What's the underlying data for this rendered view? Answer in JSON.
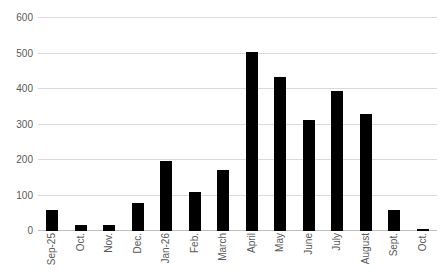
{
  "chart_data": {
    "type": "bar",
    "title": "",
    "subtitle": "",
    "xlabel": "",
    "ylabel": "",
    "categories": [
      "Sep-25",
      "Oct.",
      "Nov.",
      "Dec.",
      "Jan-26",
      "Feb.",
      "March",
      "April",
      "May",
      "June",
      "July",
      "August",
      "Sept.",
      "Oct."
    ],
    "values": [
      60,
      17,
      18,
      80,
      196,
      110,
      172,
      505,
      435,
      312,
      395,
      330,
      60,
      5
    ],
    "ylim": [
      0,
      600
    ],
    "y_ticks": [
      0,
      100,
      200,
      300,
      400,
      500,
      600
    ],
    "y_tick_labels": [
      "0",
      "100",
      "200",
      "300",
      "400",
      "500",
      "600"
    ],
    "grid": true,
    "legend": false,
    "legend_position": "none",
    "bar_color": "#000000",
    "gridline_color": "#d9d9d9",
    "axis_label_color": "#595959",
    "background_color": "#ffffff"
  }
}
